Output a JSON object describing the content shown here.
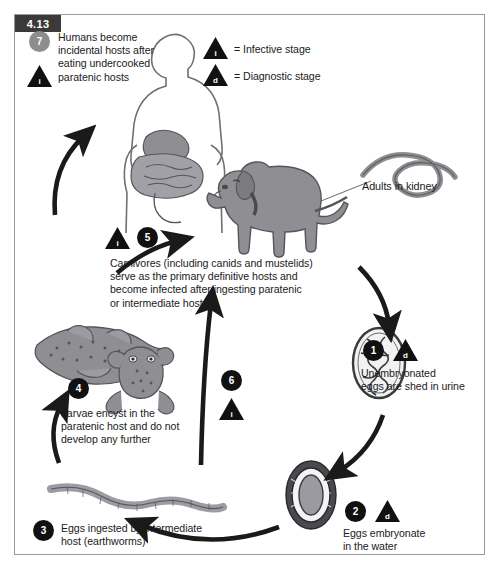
{
  "figure": {
    "number": "4.13",
    "border_color": "#9a9a9a",
    "background": "#ffffff"
  },
  "legend": {
    "items": [
      {
        "glyph": "i",
        "shape": "triangle-icon",
        "label": "= Infective stage"
      },
      {
        "glyph": "d",
        "shape": "triangle-icon",
        "label": "= Diagnostic stage"
      }
    ]
  },
  "colors": {
    "badge_dark": "#111111",
    "badge_gray": "#8d8d8d",
    "arrow": "#1a1a1a",
    "animal_fill": "#8e8e93",
    "animal_stroke": "#55555a",
    "text": "#1a1a1a"
  },
  "steps": [
    {
      "number": "1",
      "stage": "d",
      "text": "Unembryonated\neggs are shed in urine",
      "line1": "Unembryonated",
      "line2": "eggs are shed in urine"
    },
    {
      "number": "2",
      "stage": "d",
      "text": "Eggs embryonate\nin the water",
      "line1": "Eggs embryonate",
      "line2": "in the water"
    },
    {
      "number": "3",
      "stage": "",
      "text": "Eggs ingested by intermediate\nhost (earthworms)",
      "line1": "Eggs ingested by intermediate",
      "line2": "host (earthworms)"
    },
    {
      "number": "4",
      "stage": "",
      "text": "Larvae encyst in the\nparatenic host and do not\ndevelop any further",
      "line1": "Larvae encyst in the",
      "line2": "paratenic host and do not",
      "line3": "develop any further"
    },
    {
      "number": "5",
      "stage": "i",
      "text": "Carnivores (including canids and mustelids)\nserve as the primary definitive hosts and\nbecome infected after ingesting paratenic\nor intermediate hosts",
      "line1": "Carnivores (including canids and mustelids)",
      "line2": "serve as the primary definitive hosts and",
      "line3": "become infected after ingesting paratenic",
      "line4": "or intermediate hosts"
    },
    {
      "number": "6",
      "stage": "i",
      "text": ""
    },
    {
      "number": "7",
      "stage": "i",
      "text": "Humans become\nincidental hosts after\neating undercooked\nparatenic hosts",
      "line1": "Humans become",
      "line2": "incidental hosts after",
      "line3": "eating undercooked",
      "line4": "paratenic hosts"
    }
  ],
  "labels": {
    "adults_in_kidney": "Adults in kidney"
  },
  "illustrations": [
    {
      "name": "human-torso-digestive",
      "label": ""
    },
    {
      "name": "dog",
      "label": ""
    },
    {
      "name": "adult-worm",
      "label": "Adults in kidney"
    },
    {
      "name": "unembryonated-egg",
      "label": ""
    },
    {
      "name": "embryonated-egg",
      "label": ""
    },
    {
      "name": "earthworm",
      "label": ""
    },
    {
      "name": "fish",
      "label": ""
    },
    {
      "name": "frog",
      "label": ""
    }
  ]
}
